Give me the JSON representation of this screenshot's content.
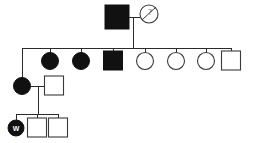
{
  "figure": {
    "kind": "pedigree-chart",
    "width": 254,
    "height": 143,
    "background_color": "#ffffff",
    "line_color": "#2b2b2b",
    "affected_fill_color": "#111111",
    "unaffected_fill_color": "#ffffff",
    "symbol_stroke_color": "#3a3a3a"
  },
  "legend_semantics": {
    "filled_square": "affected male",
    "filled_circle": "affected female",
    "open_square": "unaffected male",
    "open_circle": "unaffected female",
    "slashed_circle": "deceased female",
    "arrow_marked_circle": "proband"
  },
  "generations": [
    {
      "id": "generation-1",
      "roman": "I",
      "sibship_line": null,
      "individuals": [
        {
          "id": "I-1",
          "shape": "square",
          "sex": "male",
          "affected": true,
          "deceased": false,
          "proband": false,
          "marker": "",
          "cx": 117,
          "cy": 17,
          "size": 24
        },
        {
          "id": "I-2",
          "shape": "circle",
          "sex": "female",
          "affected": false,
          "deceased": true,
          "proband": false,
          "marker": "?",
          "cx": 149,
          "cy": 14,
          "size": 18
        }
      ],
      "mating": {
        "partner_a": "I-1",
        "partner_b": "I-2",
        "line_y": 17,
        "x_start": 129,
        "x_end": 140,
        "descent_x": 133,
        "descent_y_end": 48
      }
    },
    {
      "id": "generation-2",
      "roman": "II",
      "sibship_line": {
        "y": 48,
        "x_start": 22,
        "x_end": 229
      },
      "individuals": [
        {
          "id": "II-1",
          "shape": "none",
          "sex": "unspecified",
          "affected": false,
          "deceased": false,
          "proband": false,
          "marker": "",
          "cx": 22,
          "cy": 48,
          "size": 0
        },
        {
          "id": "II-2",
          "shape": "circle",
          "sex": "female",
          "affected": true,
          "deceased": false,
          "proband": false,
          "marker": "",
          "cx": 50,
          "cy": 60,
          "size": 17
        },
        {
          "id": "II-3",
          "shape": "circle",
          "sex": "female",
          "affected": true,
          "deceased": false,
          "proband": false,
          "marker": "",
          "cx": 81,
          "cy": 60,
          "size": 17
        },
        {
          "id": "II-4",
          "shape": "square",
          "sex": "male",
          "affected": true,
          "deceased": false,
          "proband": false,
          "marker": "",
          "cx": 113,
          "cy": 60,
          "size": 19
        },
        {
          "id": "II-5",
          "shape": "circle",
          "sex": "female",
          "affected": false,
          "deceased": false,
          "proband": false,
          "marker": "",
          "cx": 145,
          "cy": 60,
          "size": 17
        },
        {
          "id": "II-6",
          "shape": "circle",
          "sex": "female",
          "affected": false,
          "deceased": false,
          "proband": false,
          "marker": "",
          "cx": 176,
          "cy": 60,
          "size": 17
        },
        {
          "id": "II-7",
          "shape": "circle",
          "sex": "female",
          "affected": false,
          "deceased": false,
          "proband": false,
          "marker": "",
          "cx": 206,
          "cy": 60,
          "size": 17
        },
        {
          "id": "II-8",
          "shape": "square",
          "sex": "male",
          "affected": false,
          "deceased": false,
          "proband": false,
          "marker": "",
          "cx": 231,
          "cy": 60,
          "size": 19
        }
      ],
      "mating": null
    },
    {
      "id": "generation-3",
      "roman": "III",
      "sibship_line": null,
      "individuals": [
        {
          "id": "III-1",
          "shape": "circle",
          "sex": "female",
          "affected": true,
          "deceased": false,
          "proband": false,
          "marker": "",
          "cx": 22,
          "cy": 86,
          "size": 17
        },
        {
          "id": "III-2",
          "shape": "square",
          "sex": "male",
          "affected": false,
          "deceased": false,
          "proband": false,
          "marker": "",
          "cx": 54,
          "cy": 86,
          "size": 19
        }
      ],
      "mating": {
        "partner_a": "III-1",
        "partner_b": "III-2",
        "line_y": 86,
        "x_start": 31,
        "x_end": 45,
        "descent_x": 38,
        "descent_y_end": 114
      }
    },
    {
      "id": "generation-4",
      "roman": "IV",
      "sibship_line": {
        "y": 114,
        "x_start": 16,
        "x_end": 58
      },
      "individuals": [
        {
          "id": "IV-1",
          "shape": "circle",
          "sex": "female",
          "affected": true,
          "deceased": false,
          "proband": true,
          "marker": "W",
          "cx": 16,
          "cy": 127,
          "size": 16
        },
        {
          "id": "IV-2",
          "shape": "square",
          "sex": "male",
          "affected": false,
          "deceased": false,
          "proband": false,
          "marker": "",
          "cx": 37,
          "cy": 127,
          "size": 19
        },
        {
          "id": "IV-3",
          "shape": "square",
          "sex": "male",
          "affected": false,
          "deceased": false,
          "proband": false,
          "marker": "",
          "cx": 58,
          "cy": 127,
          "size": 19
        }
      ],
      "mating": null
    }
  ],
  "connector_lines": {
    "gen1_to_gen2_descent": {
      "x": 133,
      "y1": 17,
      "y2": 48
    },
    "gen2_dropstems": [
      {
        "id": "stem-II-1",
        "x": 22,
        "y1": 48,
        "y2": 77
      },
      {
        "id": "stem-II-2",
        "x": 50,
        "y1": 48,
        "y2": 52
      },
      {
        "id": "stem-II-3",
        "x": 81,
        "y1": 48,
        "y2": 52
      },
      {
        "id": "stem-II-4",
        "x": 113,
        "y1": 48,
        "y2": 51
      },
      {
        "id": "stem-II-5",
        "x": 145,
        "y1": 48,
        "y2": 52
      },
      {
        "id": "stem-II-6",
        "x": 176,
        "y1": 48,
        "y2": 52
      },
      {
        "id": "stem-II-7",
        "x": 206,
        "y1": 48,
        "y2": 52
      },
      {
        "id": "stem-II-8",
        "x": 231,
        "y1": 48,
        "y2": 51
      }
    ],
    "gen3_to_gen4_descent": {
      "x": 38,
      "y1": 86,
      "y2": 114
    },
    "gen4_dropstems": [
      {
        "id": "stem-IV-1",
        "x": 16,
        "y1": 114,
        "y2": 119
      },
      {
        "id": "stem-IV-2",
        "x": 37,
        "y1": 114,
        "y2": 118
      },
      {
        "id": "stem-IV-3",
        "x": 58,
        "y1": 114,
        "y2": 118
      }
    ]
  }
}
